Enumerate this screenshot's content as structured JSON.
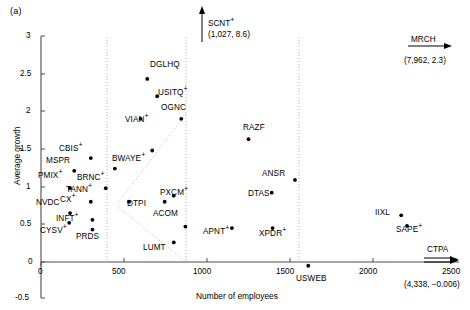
{
  "panel": {
    "label": "(a)"
  },
  "chart_data": {
    "type": "scatter",
    "title": "",
    "xlabel": "Number of employees",
    "ylabel": "Average growth",
    "xlim": [
      0,
      2600
    ],
    "ylim": [
      -0.5,
      3
    ],
    "xticks": [
      0,
      500,
      1000,
      1500,
      2000,
      2500
    ],
    "xticklabels": [
      "0",
      "500",
      "1000",
      "1500",
      "2000",
      "2500"
    ],
    "yticks": [
      -0.5,
      0,
      0.5,
      1,
      1.5,
      2,
      2.5,
      3
    ],
    "yticklabels": [
      "-0.5",
      "0",
      "0.5",
      "1",
      "1.5",
      "2",
      "2.5",
      "3"
    ],
    "grid": "vertical-dotted",
    "vertical_gridlines": [
      450,
      1000,
      1620
    ],
    "legend": "none",
    "points": [
      {
        "label": "DGLHQ",
        "x": 640,
        "y": 2.43,
        "marker_plus": false,
        "lx": 150,
        "ly": 61
      },
      {
        "label": "USITQ",
        "x": 700,
        "y": 2.2,
        "marker_plus": true,
        "lx": 158,
        "ly": 89
      },
      {
        "label": "OGNC",
        "x": 845,
        "y": 1.9,
        "marker_plus": false,
        "lx": 161,
        "ly": 104
      },
      {
        "label": "VIAN",
        "x": 600,
        "y": 1.9,
        "marker_plus": true,
        "lx": 125,
        "ly": 116
      },
      {
        "label": "RAZF",
        "x": 1250,
        "y": 1.63,
        "marker_plus": false,
        "lx": 243,
        "ly": 124
      },
      {
        "label": "CBIS",
        "x": 300,
        "y": 1.38,
        "marker_plus": true,
        "lx": 59,
        "ly": 145
      },
      {
        "label": "BWAYE",
        "x": 670,
        "y": 1.48,
        "marker_plus": true,
        "lx": 112,
        "ly": 155
      },
      {
        "label": "MSPR",
        "x": 200,
        "y": 1.21,
        "marker_plus": false,
        "lx": 46,
        "ly": 157
      },
      {
        "label": "BRNC",
        "x": 445,
        "y": 1.24,
        "marker_plus": true,
        "lx": 77,
        "ly": 174
      },
      {
        "label": "PMIX",
        "x": 175,
        "y": 0.98,
        "marker_plus": true,
        "lx": 38,
        "ly": 172
      },
      {
        "label": "TANN",
        "x": 390,
        "y": 0.98,
        "marker_plus": true,
        "lx": 66,
        "ly": 186
      },
      {
        "label": "NVDC",
        "x": 175,
        "y": 0.65,
        "marker_plus": false,
        "lx": 36,
        "ly": 199
      },
      {
        "label": "CX",
        "x": 300,
        "y": 0.8,
        "marker_plus": true,
        "lx": 60,
        "ly": 196
      },
      {
        "label": "ANSR",
        "x": 1530,
        "y": 1.09,
        "marker_plus": false,
        "lx": 262,
        "ly": 170
      },
      {
        "label": "DTAS",
        "x": 1390,
        "y": 0.92,
        "marker_plus": false,
        "lx": 248,
        "ly": 190
      },
      {
        "label": "PXCM",
        "x": 800,
        "y": 0.88,
        "marker_plus": true,
        "lx": 160,
        "ly": 189
      },
      {
        "label": "DTPI",
        "x": 745,
        "y": 0.8,
        "marker_plus": false,
        "lx": 127,
        "ly": 200
      },
      {
        "label": "INFT",
        "x": 310,
        "y": 0.56,
        "marker_plus": true,
        "lx": 56,
        "ly": 215
      },
      {
        "label": "ACOM",
        "x": 870,
        "y": 0.47,
        "marker_plus": false,
        "lx": 153,
        "ly": 210
      },
      {
        "label": "IIXL",
        "x": 2170,
        "y": 0.62,
        "marker_plus": false,
        "lx": 375,
        "ly": 209
      },
      {
        "label": "CYSV",
        "x": 170,
        "y": 0.52,
        "marker_plus": true,
        "lx": 40,
        "ly": 227
      },
      {
        "label": "PRDS",
        "x": 310,
        "y": 0.43,
        "marker_plus": false,
        "lx": 76,
        "ly": 233
      },
      {
        "label": "APNT",
        "x": 1150,
        "y": 0.45,
        "marker_plus": true,
        "lx": 203,
        "ly": 228
      },
      {
        "label": "XPDR",
        "x": 1395,
        "y": 0.45,
        "marker_plus": true,
        "lx": 259,
        "ly": 230
      },
      {
        "label": "SAPE",
        "x": 2205,
        "y": 0.48,
        "marker_plus": true,
        "lx": 396,
        "ly": 226
      },
      {
        "label": "LUMT",
        "x": 800,
        "y": 0.26,
        "marker_plus": false,
        "lx": 143,
        "ly": 244
      },
      {
        "label": "USWEB",
        "x": 1610,
        "y": -0.05,
        "marker_plus": false,
        "lx": 296,
        "ly": 275
      },
      {
        "label": "CYSV2",
        "x": 530,
        "y": 0.8,
        "marker_plus": false,
        "hidden_label": true,
        "lx": 0,
        "ly": 0
      }
    ],
    "annotations": [
      {
        "name": "scnt",
        "label": "SCNT",
        "marker_plus": true,
        "coords": "(1,027, 8.6)",
        "direction": "up",
        "x_px": 200,
        "y_px": 12
      },
      {
        "name": "mrch",
        "label": "MRCH",
        "marker_plus": false,
        "coords": "(7,962, 2.3)",
        "direction": "right",
        "x_px": 404,
        "y_px": 36
      },
      {
        "name": "ctpa",
        "label": "CTPA",
        "marker_plus": false,
        "coords": "(4,338, −0.006)",
        "direction": "right",
        "x_px": 420,
        "y_px": 242
      }
    ],
    "colors": {
      "marker": "#000000",
      "axis": "#4d4d4d",
      "gridline": "#9a9a9a",
      "wedge": "#a8a8a8",
      "background": "#ffffff"
    }
  }
}
